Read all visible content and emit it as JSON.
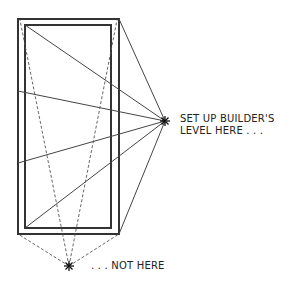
{
  "diagram": {
    "labels": {
      "good_position": [
        "SET UP BUILDER'S",
        "LEVEL HERE . . ."
      ],
      "bad_position": ". . . NOT HERE"
    },
    "colors": {
      "line": "#333333",
      "background": "#ffffff"
    }
  }
}
